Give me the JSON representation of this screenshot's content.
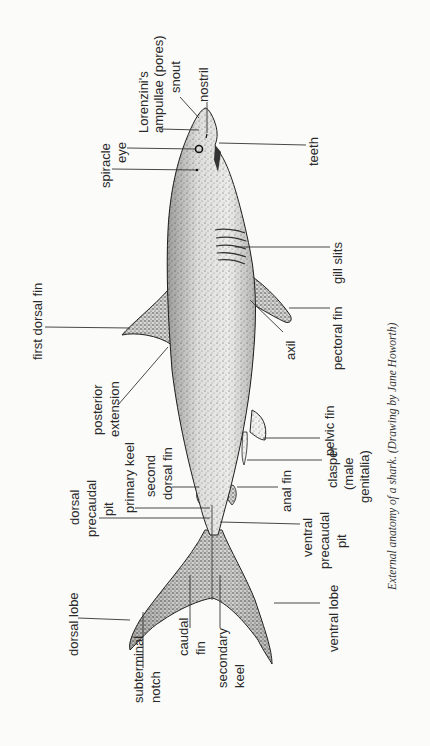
{
  "figure": {
    "caption": "External anatomy of a shark. (Drawing by Jane Howorth)",
    "orientation": "rotated 90° counter-clockwise"
  },
  "labels": {
    "snout": "snout",
    "nostril": "nostril",
    "lorenzini_1": "Lorenzini's",
    "lorenzini_2": "ampullae (pores)",
    "eye": "eye",
    "spiracle": "spiracle",
    "teeth": "teeth",
    "gill_slits": "gill slits",
    "pectoral_fin": "pectoral fin",
    "first_dorsal_fin": "first dorsal fin",
    "posterior_extension_1": "posterior",
    "posterior_extension_2": "extension",
    "axil": "axil",
    "pelvic_fin": "pelvic fin",
    "primary_keel": "primary keel",
    "second_dorsal_1": "second",
    "second_dorsal_2": "dorsal fin",
    "clasper_1": "clasper",
    "clasper_2": "(male",
    "clasper_3": "genitalia)",
    "anal_fin": "anal fin",
    "dorsal_precaudal_1": "dorsal",
    "dorsal_precaudal_2": "precaudal",
    "dorsal_precaudal_3": "pit",
    "ventral_precaudal_1": "ventral",
    "ventral_precaudal_2": "precaudal",
    "ventral_precaudal_3": "pit",
    "dorsal_lobe": "dorsal lobe",
    "subterminal_1": "subterminal",
    "subterminal_2": "notch",
    "caudal_1": "caudal",
    "caudal_2": "fin",
    "secondary_keel_1": "secondary",
    "secondary_keel_2": "keel",
    "ventral_lobe": "ventral lobe"
  },
  "colors": {
    "background": "#fbfbf9",
    "ink": "#222222"
  }
}
